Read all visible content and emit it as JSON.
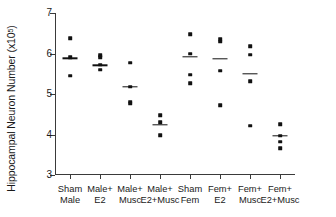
{
  "chart_data": {
    "type": "scatter",
    "title": "",
    "xlabel": "",
    "ylabel": "Hippocampal Neuron Number (x10",
    "ylabel_exponent": "5",
    "ylabel_suffix": ")",
    "ylim": [
      3,
      7
    ],
    "yticks": [
      3,
      4,
      5,
      6,
      7
    ],
    "ytick_labels": [
      "3",
      "4",
      "5",
      "6",
      "7"
    ],
    "grid": false,
    "legend": "none",
    "marker": "filled-square",
    "mean_marker": "horizontal-line",
    "categories": [
      "Sham Male",
      "Male+ E2",
      "Male+ Musc",
      "Male+ E2+Musc",
      "Sham Fem",
      "Fem+ E2",
      "Fem+ Musc",
      "Fem+ E2+Musc"
    ],
    "category_lines": [
      [
        "Sham",
        "Male"
      ],
      [
        "Male+",
        "E2"
      ],
      [
        "Male+",
        "Musc"
      ],
      [
        "Male+",
        "E2+Musc"
      ],
      [
        "Sham",
        "Fem"
      ],
      [
        "Fem+",
        "E2"
      ],
      [
        "Fem+",
        "Musc"
      ],
      [
        "Fem+",
        "E2+Musc"
      ]
    ],
    "groups": [
      {
        "name": "Sham Male",
        "values": [
          6.38,
          5.91,
          5.45
        ],
        "mean": 5.88
      },
      {
        "name": "Male+ E2",
        "values": [
          5.96,
          5.91,
          5.72,
          5.6
        ],
        "mean": 5.71
      },
      {
        "name": "Male+ Musc",
        "values": [
          5.77,
          5.18,
          4.81,
          4.76
        ],
        "mean": 5.18
      },
      {
        "name": "Male+ E2+Musc",
        "values": [
          4.47,
          4.3,
          3.98
        ],
        "mean": 4.24
      },
      {
        "name": "Sham Fem",
        "values": [
          6.47,
          6.0,
          5.48,
          5.27
        ],
        "mean": 5.92
      },
      {
        "name": "Fem+ E2",
        "values": [
          6.36,
          6.29,
          5.58,
          4.73
        ],
        "mean": 5.87
      },
      {
        "name": "Fem+ Musc",
        "values": [
          6.18,
          5.97,
          5.32,
          4.22
        ],
        "mean": 5.5
      },
      {
        "name": "Fem+ E2+Musc",
        "values": [
          4.26,
          3.97,
          3.82,
          3.66
        ],
        "mean": 3.97
      }
    ]
  }
}
